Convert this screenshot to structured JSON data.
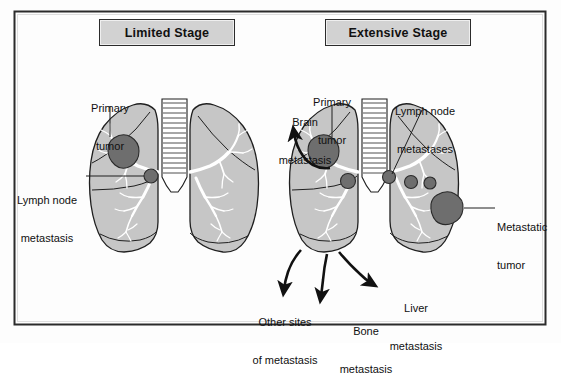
{
  "figure": {
    "frame_color": "#2b2b2b",
    "background_color": "#fdfdfd"
  },
  "colors": {
    "lung_fill": "#c6c6c6",
    "lung_outline": "#1f1f1f",
    "tumor_fill": "#6e6e6e",
    "tumor_outline": "#2a2a2a",
    "bronchi_fill": "#ffffff",
    "box_fill": "#d2d2d2",
    "text": "#101010",
    "arrow": "#111111"
  },
  "panels": [
    {
      "id": "limited-stage",
      "title": "Limited Stage",
      "labels": [
        {
          "id": "primary-tumor",
          "text": "Primary\ntumor",
          "lines": [
            "Primary",
            "tumor"
          ]
        },
        {
          "id": "lymph-node-metastasis",
          "text": "Lymph node\nmetastasis",
          "lines": [
            "Lymph node",
            "metastasis"
          ]
        }
      ],
      "lesions": [
        {
          "id": "primary-tumor-mass",
          "kind": "primary-tumor"
        },
        {
          "id": "lymph-node-mass",
          "kind": "lymph-node"
        }
      ]
    },
    {
      "id": "extensive-stage",
      "title": "Extensive Stage",
      "labels": [
        {
          "id": "primary-tumor",
          "text": "Primary\ntumor",
          "lines": [
            "Primary",
            "tumor"
          ]
        },
        {
          "id": "brain-metastasis",
          "text": "Brain\nmetastasis",
          "lines": [
            "Brain",
            "metastasis"
          ]
        },
        {
          "id": "lymph-node-metastases",
          "text": "Lymph node\nmetastases",
          "lines": [
            "Lymph node",
            "metastases"
          ]
        },
        {
          "id": "metastatic-tumor",
          "text": "Metastatic\ntumor",
          "lines": [
            "Metastatic",
            "tumor"
          ]
        },
        {
          "id": "other-sites-of-metastasis",
          "text": "Other sites\nof metastasis",
          "lines": [
            "Other sites",
            "of metastasis"
          ]
        },
        {
          "id": "bone-metastasis",
          "text": "Bone\nmetastasis",
          "lines": [
            "Bone",
            "metastasis"
          ]
        },
        {
          "id": "liver-metastasis",
          "text": "Liver\nmetastasis",
          "lines": [
            "Liver",
            "metastasis"
          ]
        }
      ],
      "lesions": [
        {
          "id": "primary-tumor-mass",
          "kind": "primary-tumor"
        },
        {
          "id": "lymph-node-mass-1",
          "kind": "lymph-node"
        },
        {
          "id": "lymph-node-mass-2",
          "kind": "lymph-node"
        },
        {
          "id": "lymph-node-mass-3",
          "kind": "lymph-node"
        },
        {
          "id": "lymph-node-mass-4",
          "kind": "lymph-node"
        },
        {
          "id": "metastatic-tumor-mass",
          "kind": "metastatic-tumor"
        }
      ]
    }
  ],
  "text": {
    "limited_title": "Limited Stage",
    "extensive_title": "Extensive Stage",
    "primary_tumor_l1": "Primary",
    "primary_tumor_l2": "tumor",
    "lymph_node_metastasis_l1": "Lymph node",
    "lymph_node_metastasis_l2": "metastasis",
    "brain_metastasis_l1": "Brain",
    "brain_metastasis_l2": "metastasis",
    "lymph_node_metastases_l1": "Lymph node",
    "lymph_node_metastases_l2": "metastases",
    "metastatic_tumor_l1": "Metastatic",
    "metastatic_tumor_l2": "tumor",
    "other_sites_l1": "Other sites",
    "other_sites_l2": "of metastasis",
    "bone_metastasis_l1": "Bone",
    "bone_metastasis_l2": "metastasis",
    "liver_metastasis_l1": "Liver",
    "liver_metastasis_l2": "metastasis"
  }
}
